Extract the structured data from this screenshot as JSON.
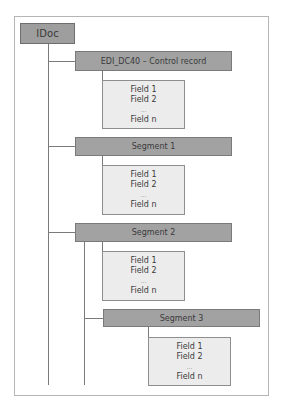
{
  "diagram": {
    "root": {
      "label": "IDoc"
    },
    "nodes": [
      {
        "label": "EDI_DC40 – Control record",
        "fields": [
          "Field 1",
          "Field 2",
          "...",
          "Field n"
        ]
      },
      {
        "label": "Segment 1",
        "fields": [
          "Field 1",
          "Field 2",
          "...",
          "Field n"
        ]
      },
      {
        "label": "Segment 2",
        "fields": [
          "Field 1",
          "Field 2",
          "...",
          "Field n"
        ],
        "children": [
          {
            "label": "Segment 3",
            "fields": [
              "Field 1",
              "Field 2",
              "...",
              "Field n"
            ]
          }
        ]
      }
    ]
  },
  "colors": {
    "segment_fill": "#a2a2a2",
    "field_fill": "#ececec",
    "line": "#7a7a7a"
  }
}
